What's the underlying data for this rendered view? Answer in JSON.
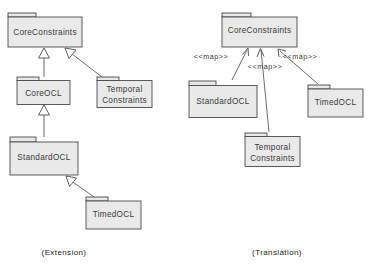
{
  "diagrams": {
    "extension": {
      "caption": "(Extension)",
      "packages": {
        "core_constraints": "CoreConstraints",
        "core_ocl": "CoreOCL",
        "temporal_constraints": [
          "Temporal",
          "Constraints"
        ],
        "standard_ocl": "StandardOCL",
        "timed_ocl": "TimedOCL"
      },
      "relations": [
        {
          "from": "CoreOCL",
          "to": "CoreConstraints",
          "type": "generalization"
        },
        {
          "from": "Temporal Constraints",
          "to": "CoreConstraints",
          "type": "generalization"
        },
        {
          "from": "StandardOCL",
          "to": "CoreOCL",
          "type": "generalization"
        },
        {
          "from": "TimedOCL",
          "to": "StandardOCL",
          "type": "generalization"
        }
      ]
    },
    "translation": {
      "caption": "(Translation)",
      "packages": {
        "core_constraints": "CoreConstraints",
        "standard_ocl": "StandardOCL",
        "temporal_constraints": [
          "Temporal",
          "Constraints"
        ],
        "timed_ocl": "TimedOCL"
      },
      "stereotypes": {
        "map_left": "<<map>>",
        "map_center": "<<map>>",
        "map_right": "<<map>>"
      },
      "relations": [
        {
          "from": "StandardOCL",
          "to": "CoreConstraints",
          "type": "dependency",
          "stereotype": "<<map>>"
        },
        {
          "from": "Temporal Constraints",
          "to": "CoreConstraints",
          "type": "dependency",
          "stereotype": "<<map>>"
        },
        {
          "from": "TimedOCL",
          "to": "CoreConstraints",
          "type": "dependency",
          "stereotype": "<<map>>"
        }
      ]
    }
  },
  "colors": {
    "package_fill": "#e9e9e9",
    "stroke": "#4a4a4a",
    "text": "#3a3a3a",
    "background": "#ffffff"
  }
}
